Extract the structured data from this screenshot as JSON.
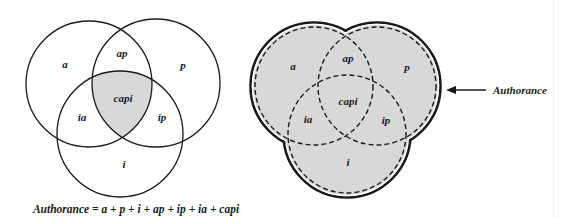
{
  "left_diagram": {
    "description": "Three-circle Venn diagram with central intersection shaded",
    "regions": {
      "a": "a",
      "p": "p",
      "i": "i",
      "ap": "ap",
      "ia": "ia",
      "ip": "ip",
      "capi": "capi"
    },
    "shaded_region": "capi",
    "formula": "Authorance = a + p + i + ap + ip + ia + capi"
  },
  "right_diagram": {
    "description": "Three dashed circles with the whole union shaded and outlined",
    "regions": {
      "a": "a",
      "p": "p",
      "i": "i",
      "ap": "ap",
      "ia": "ia",
      "ip": "ip",
      "capi": "capi"
    },
    "shaded_region": "union",
    "callout_label": "Authorance"
  },
  "colors": {
    "stroke": "#1a1a1a",
    "shade": "#d8d8d8",
    "background": "#ffffff"
  }
}
